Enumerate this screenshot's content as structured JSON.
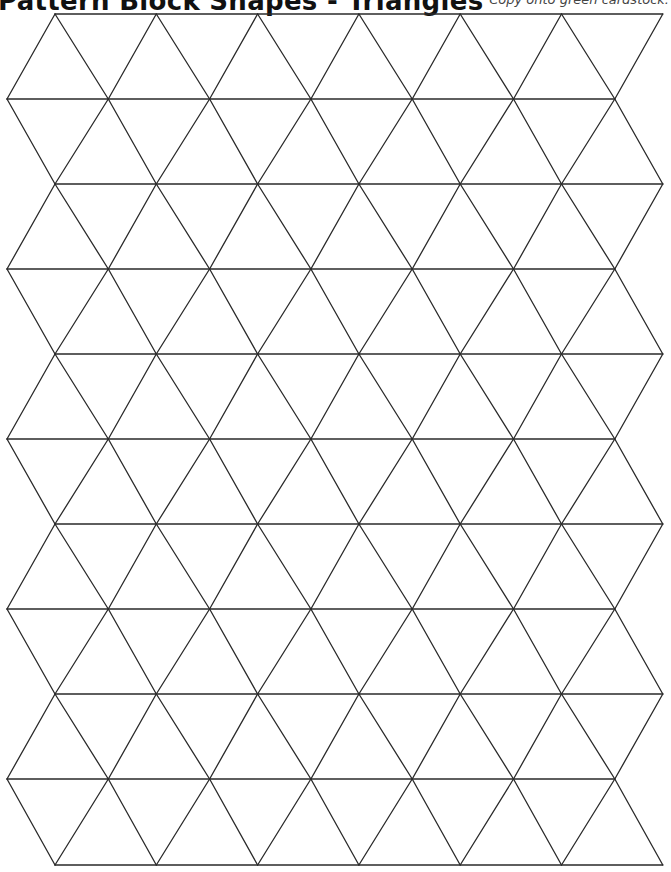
{
  "header": {
    "title": "Pattern Block Shapes - Triangles",
    "instruction": "Copy onto green cardstock."
  },
  "grid": {
    "shape": "equilateral-triangle",
    "rows": 10,
    "row_ys": [
      14,
      99,
      184,
      269,
      354,
      439,
      524,
      609,
      694,
      779,
      865
    ],
    "even_row_x_start": 55,
    "odd_row_x_start": 7,
    "cell_width": 101.3,
    "line_color": "#2a2a2a"
  }
}
